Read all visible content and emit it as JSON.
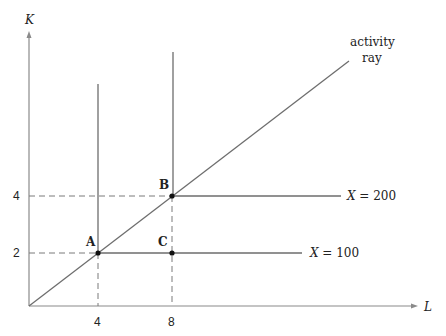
{
  "diagram": {
    "type": "isoquant-activity-ray",
    "axes": {
      "x_label": "L",
      "y_label": "K",
      "x_ticks": [
        "4",
        "8"
      ],
      "y_ticks": [
        "2",
        "4"
      ]
    },
    "points": [
      {
        "label": "A",
        "L": 4,
        "K": 2
      },
      {
        "label": "B",
        "L": 8,
        "K": 4
      },
      {
        "label": "C",
        "L": 8,
        "K": 2
      }
    ],
    "isoquants": [
      {
        "label": "X = 100",
        "var": "X",
        "value": "100",
        "corner_L": 4,
        "corner_K": 2
      },
      {
        "label": "X = 200",
        "var": "X",
        "value": "200",
        "corner_L": 8,
        "corner_K": 4
      }
    ],
    "ray": {
      "label_line1": "activity",
      "label_line2": "ray"
    },
    "colors": {
      "line": "#6e6e6e",
      "text": "#222222",
      "point": "#111111"
    }
  }
}
